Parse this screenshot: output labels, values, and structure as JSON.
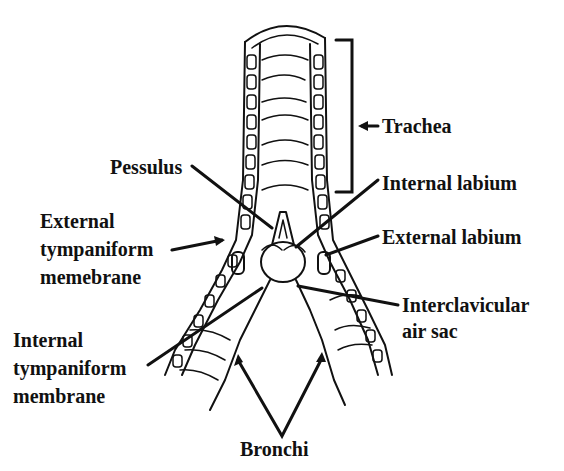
{
  "diagram": {
    "colors": {
      "ink": "#111111",
      "background": "#ffffff"
    },
    "labels": {
      "trachea": "Trachea",
      "pessulus": "Pessulus",
      "internal_labium": "Internal labium",
      "external_labium": "External labium",
      "external_tympaniform_l1": "External",
      "external_tympaniform_l2": "tympaniform",
      "external_tympaniform_l3": "memebrane",
      "interclavicular_l1": "Interclavicular",
      "interclavicular_l2": "air sac",
      "internal_tympaniform_l1": "Internal",
      "internal_tympaniform_l2": "tympaniform",
      "internal_tympaniform_l3": "membrane",
      "bronchi": "Bronchi"
    }
  }
}
